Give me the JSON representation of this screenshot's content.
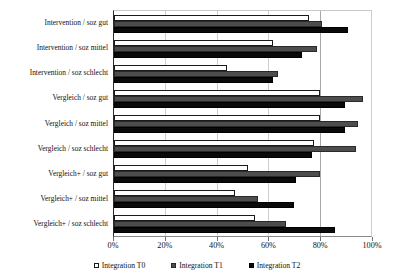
{
  "chart_data": {
    "type": "bar",
    "orientation": "horizontal",
    "title": "",
    "xlabel": "",
    "ylabel": "",
    "xlim": [
      0,
      100
    ],
    "xtick_labels": [
      "0%",
      "20%",
      "40%",
      "60%",
      "80%",
      "100%"
    ],
    "xtick_values": [
      0,
      20,
      40,
      60,
      80,
      100
    ],
    "grid": true,
    "grid_axis": "x",
    "reference_line": 80,
    "legend_position": "bottom",
    "categories": [
      "Intervention / soz gut",
      "Intervention / soz mittel",
      "Intervention / soz schlecht",
      "Vergleich / soz gut",
      "Vergleich / soz mittel",
      "Vergleich / soz schlecht",
      "Vergleich+ / soz gut",
      "Vergleich+ / soz mittel",
      "Vergleich+ / soz schlecht"
    ],
    "series": [
      {
        "name": "Integration T0",
        "color": "#ffffff",
        "values": [
          76,
          62,
          44,
          80,
          80,
          78,
          52,
          47,
          55
        ]
      },
      {
        "name": "Integration T1",
        "color": "#4d4d4d",
        "values": [
          81,
          79,
          64,
          97,
          95,
          94,
          80,
          56,
          67
        ]
      },
      {
        "name": "Integration T2",
        "color": "#0a0a0a",
        "values": [
          91,
          73,
          62,
          90,
          90,
          77,
          71,
          70,
          86
        ]
      }
    ]
  },
  "legend": {
    "items": [
      {
        "label": "Integration T0",
        "swatch": "white-square-icon"
      },
      {
        "label": "Integration T1",
        "swatch": "gray-square-icon"
      },
      {
        "label": "Integration T2",
        "swatch": "black-square-icon"
      }
    ]
  }
}
